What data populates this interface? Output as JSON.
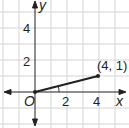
{
  "diagram": {
    "type": "coordinate-plane",
    "axes": {
      "x_label": "x",
      "y_label": "y",
      "origin_label": "O",
      "x_ticks": [
        "2",
        "4"
      ],
      "y_ticks": [
        "2",
        "4"
      ]
    },
    "segment": {
      "from": [
        0,
        0
      ],
      "to": [
        4,
        1
      ],
      "endpoint_label": "(4, 1)"
    },
    "angle_marker": "arc between x-axis and segment at origin",
    "colors": {
      "grid": "#cfcfcf",
      "axis": "#231f20",
      "segment": "#231f20"
    }
  }
}
